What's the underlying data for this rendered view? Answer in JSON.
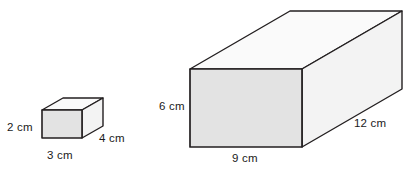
{
  "figure": {
    "type": "geometry-diagram",
    "background_color": "#ffffff",
    "stroke_color": "#231f20",
    "face_colors": {
      "top": "#fafafa",
      "front": "#e3e3e3",
      "side": "#f3f3f3"
    },
    "shapes": [
      {
        "name": "small-rectangular-prism",
        "labels": {
          "height": "2 cm",
          "width": "3 cm",
          "depth": "4 cm"
        },
        "dimensions_cm": {
          "height": 2,
          "width": 3,
          "depth": 4
        },
        "geometry": {
          "front_left_x": 42,
          "front_right_x": 82,
          "front_top_y": 110,
          "front_bottom_y": 138,
          "depth_dx": 21,
          "depth_dy": -12
        }
      },
      {
        "name": "large-rectangular-prism",
        "labels": {
          "height": "6 cm",
          "width": "9 cm",
          "depth": "12 cm"
        },
        "dimensions_cm": {
          "height": 6,
          "width": 9,
          "depth": 12
        },
        "geometry": {
          "front_left_x": 190,
          "front_right_x": 302,
          "front_top_y": 69,
          "front_bottom_y": 147,
          "depth_dx": 100,
          "depth_dy": -58
        }
      }
    ]
  }
}
